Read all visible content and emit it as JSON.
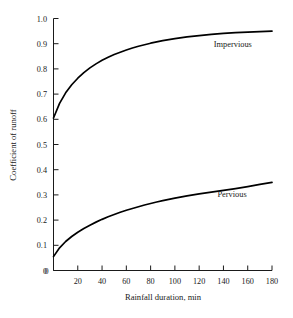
{
  "chart_data": {
    "type": "line",
    "title": "",
    "xlabel": "Rainfall duration, min",
    "ylabel": "Coefficient of runoff",
    "xlim": [
      0,
      180
    ],
    "ylim": [
      0,
      1.0
    ],
    "grid": false,
    "legend_position": "inline-right",
    "xticks": [
      0,
      20,
      40,
      60,
      80,
      100,
      120,
      140,
      160,
      180
    ],
    "xtick_labels": [
      "0",
      "20",
      "40",
      "60",
      "80",
      "100",
      "120",
      "140",
      "160",
      "180"
    ],
    "yticks": [
      0,
      0.1,
      0.2,
      0.3,
      0.4,
      0.5,
      0.6,
      0.7,
      0.8,
      0.9,
      1.0
    ],
    "ytick_labels": [
      "0",
      "0.1",
      "0.2",
      "0.3",
      "0.4",
      "0.5",
      "0.6",
      "0.7",
      "0.8",
      "0.9",
      "1.0"
    ],
    "x": [
      0,
      5,
      10,
      15,
      20,
      25,
      30,
      35,
      40,
      45,
      50,
      55,
      60,
      65,
      70,
      75,
      80,
      85,
      90,
      95,
      100,
      110,
      120,
      130,
      140,
      150,
      160,
      170,
      180
    ],
    "series": [
      {
        "name": "Impervious",
        "color": "#000000",
        "label_x": 132,
        "label_y": 0.885,
        "values": [
          0.605,
          0.663,
          0.705,
          0.737,
          0.763,
          0.785,
          0.804,
          0.82,
          0.834,
          0.846,
          0.857,
          0.866,
          0.875,
          0.883,
          0.89,
          0.896,
          0.902,
          0.907,
          0.912,
          0.916,
          0.92,
          0.927,
          0.932,
          0.937,
          0.941,
          0.944,
          0.946,
          0.948,
          0.95
        ]
      },
      {
        "name": "Pervious",
        "color": "#000000",
        "label_x": 135,
        "label_y": 0.293,
        "values": [
          0.055,
          0.09,
          0.115,
          0.135,
          0.152,
          0.167,
          0.18,
          0.192,
          0.203,
          0.213,
          0.222,
          0.231,
          0.239,
          0.246,
          0.253,
          0.26,
          0.266,
          0.272,
          0.277,
          0.282,
          0.287,
          0.296,
          0.304,
          0.311,
          0.318,
          0.325,
          0.333,
          0.342,
          0.35
        ]
      }
    ]
  }
}
